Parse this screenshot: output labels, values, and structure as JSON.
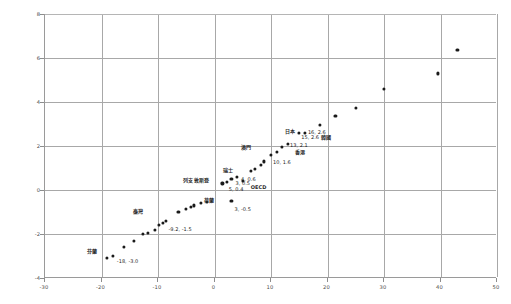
{
  "chart_data": {
    "type": "scatter",
    "title": "",
    "xlabel": "",
    "ylabel": "",
    "xlim": [
      -30,
      50
    ],
    "ylim": [
      -4,
      8
    ],
    "xticks": [
      -30,
      -20,
      -10,
      0,
      10,
      20,
      30,
      40,
      50
    ],
    "yticks": [
      -4,
      -2,
      0,
      2,
      4,
      6,
      8
    ],
    "xtick_labels": [
      "-30",
      "-20",
      "-10",
      "0",
      "10",
      "20",
      "30",
      "40",
      "50"
    ],
    "ytick_labels": [
      "-4",
      "-2",
      "0",
      "2",
      "4",
      "6",
      "8"
    ],
    "grid": true,
    "legend": false,
    "points": [
      {
        "x": -18.0,
        "y": -3.0
      },
      {
        "x": -19.0,
        "y": -3.1
      },
      {
        "x": -16.0,
        "y": -2.6
      },
      {
        "x": -14.2,
        "y": -2.3
      },
      {
        "x": -12.6,
        "y": -2.0
      },
      {
        "x": -11.8,
        "y": -1.95
      },
      {
        "x": -10.6,
        "y": -1.8
      },
      {
        "x": -9.8,
        "y": -1.6
      },
      {
        "x": -9.2,
        "y": -1.5
      },
      {
        "x": -8.6,
        "y": -1.4
      },
      {
        "x": -6.4,
        "y": -1.0
      },
      {
        "x": -5.0,
        "y": -0.85
      },
      {
        "x": -4.2,
        "y": -0.75
      },
      {
        "x": -3.6,
        "y": -0.7
      },
      {
        "x": -2.4,
        "y": -0.6
      },
      {
        "x": -1.4,
        "y": -0.55
      },
      {
        "x": 3.0,
        "y": -0.5
      },
      {
        "x": 1.4,
        "y": 0.3
      },
      {
        "x": 2.2,
        "y": 0.35
      },
      {
        "x": 5.0,
        "y": 0.4
      },
      {
        "x": 3.0,
        "y": 0.5
      },
      {
        "x": 4.0,
        "y": 0.6
      },
      {
        "x": 6.4,
        "y": 0.85
      },
      {
        "x": 7.2,
        "y": 0.95
      },
      {
        "x": 8.2,
        "y": 1.15
      },
      {
        "x": 8.8,
        "y": 1.3
      },
      {
        "x": 10.0,
        "y": 1.6
      },
      {
        "x": 11.0,
        "y": 1.75
      },
      {
        "x": 12.0,
        "y": 1.95
      },
      {
        "x": 13.0,
        "y": 2.1
      },
      {
        "x": 15.0,
        "y": 2.6
      },
      {
        "x": 16.0,
        "y": 2.6
      },
      {
        "x": 18.6,
        "y": 2.95
      },
      {
        "x": 21.4,
        "y": 3.35
      },
      {
        "x": 25.0,
        "y": 3.75
      },
      {
        "x": 30.0,
        "y": 4.6
      },
      {
        "x": 39.6,
        "y": 5.3
      },
      {
        "x": 43.0,
        "y": 6.35
      }
    ],
    "annotations": [
      {
        "name": "芬蘭",
        "value": "-18, -3.0",
        "x": -18.0,
        "y": -3.0
      },
      {
        "name": "臺灣",
        "value": "-9.2, -1.5",
        "x": -9.2,
        "y": -1.5
      },
      {
        "name": "荷蘭",
        "value": "3, -0.5",
        "x": 3.0,
        "y": -0.5
      },
      {
        "name": "列支敦斯登",
        "value": "3, 0.5",
        "x": 3.0,
        "y": 0.5
      },
      {
        "name": "瑞士",
        "value": "4, 0.6",
        "x": 4.0,
        "y": 0.6
      },
      {
        "name": "OECD",
        "value": "5, 0.4",
        "x": 5.0,
        "y": 0.4
      },
      {
        "name": "澳門",
        "value": "10, 1.6",
        "x": 10.0,
        "y": 1.6
      },
      {
        "name": "香港",
        "value": "13, 2.1",
        "x": 13.0,
        "y": 2.1
      },
      {
        "name": "韓國",
        "value": "15, 2.6",
        "x": 15.0,
        "y": 2.6
      },
      {
        "name": "日本",
        "value": "16, 2.6",
        "x": 16.0,
        "y": 2.6
      }
    ],
    "colors": {
      "point": "#1a1a1a",
      "grid": "#a8a8a8",
      "axis": "#8d8d8d",
      "text": "#2b2b2b",
      "background": "#ffffff"
    }
  }
}
